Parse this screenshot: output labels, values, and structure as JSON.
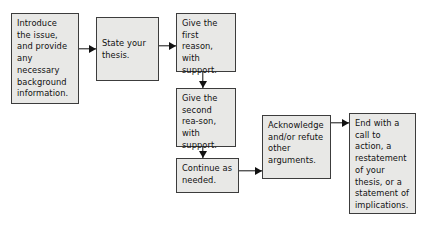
{
  "diagram": {
    "colors": {
      "node_fill": "#e8e8e6",
      "node_border": "#3c3c3c",
      "text": "#111111",
      "arrow": "#111111",
      "background": "#ffffff"
    },
    "nodes": [
      {
        "id": "introduce",
        "label": "Introduce the issue, and provide any necessary background information.",
        "x": 11,
        "y": 13,
        "w": 68,
        "h": 91,
        "align": "top"
      },
      {
        "id": "thesis",
        "label": "State your thesis.",
        "x": 96,
        "y": 17,
        "w": 63,
        "h": 64,
        "align": "center"
      },
      {
        "id": "first-reason",
        "label": "Give the first reason, with support.",
        "x": 176,
        "y": 13,
        "w": 60,
        "h": 59,
        "align": "top"
      },
      {
        "id": "second-reason",
        "label": "Give the second rea-son, with support.",
        "x": 176,
        "y": 88,
        "w": 60,
        "h": 59,
        "align": "top"
      },
      {
        "id": "continue",
        "label": "Continue as needed.",
        "x": 176,
        "y": 158,
        "w": 63,
        "h": 35,
        "align": "top"
      },
      {
        "id": "acknowledge",
        "label": "Acknowledge and/or refute other arguments.",
        "x": 262,
        "y": 115,
        "w": 69,
        "h": 64,
        "align": "top"
      },
      {
        "id": "conclusion",
        "label": "End with a call to action, a restatement of your thesis, or a statement of implications.",
        "x": 349,
        "y": 113,
        "w": 67,
        "h": 101,
        "align": "top"
      }
    ],
    "connectors": [
      {
        "id": "introduce-to-thesis",
        "from": "introduce",
        "to": "thesis",
        "direction": "right",
        "x": 79,
        "y": 44,
        "w": 17,
        "h": 10
      },
      {
        "id": "thesis-to-first-reason",
        "from": "thesis",
        "to": "first-reason",
        "direction": "right",
        "x": 159,
        "y": 41,
        "w": 17,
        "h": 10
      },
      {
        "id": "first-to-second-reason",
        "from": "first-reason",
        "to": "second-reason",
        "direction": "down",
        "x": 198,
        "y": 72,
        "w": 10,
        "h": 16
      },
      {
        "id": "second-reason-to-continue",
        "from": "second-reason",
        "to": "continue",
        "direction": "down",
        "x": 198,
        "y": 147,
        "w": 10,
        "h": 11
      },
      {
        "id": "continue-to-acknowledge",
        "from": "continue",
        "to": "acknowledge",
        "direction": "right",
        "x": 239,
        "y": 166,
        "w": 23,
        "h": 10
      },
      {
        "id": "acknowledge-to-conclusion",
        "from": "acknowledge",
        "to": "conclusion",
        "direction": "right",
        "x": 331,
        "y": 118,
        "w": 18,
        "h": 10
      }
    ]
  }
}
